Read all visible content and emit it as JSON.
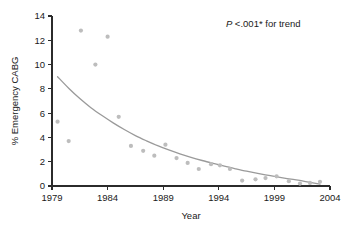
{
  "chart_data": {
    "type": "scatter",
    "title": "",
    "xlabel": "Year",
    "ylabel": "% Emergency CABG",
    "xlim": [
      1979,
      2004
    ],
    "ylim": [
      0,
      14
    ],
    "xticks": [
      1979,
      1984,
      1989,
      1994,
      1999,
      2004
    ],
    "xtick_labels": [
      "1979",
      "1984",
      "1989",
      "1994",
      "1999",
      "2004"
    ],
    "yticks": [
      0,
      2,
      4,
      6,
      8,
      10,
      12,
      14
    ],
    "ytick_labels": [
      "0",
      "2",
      "4",
      "6",
      "8",
      "10",
      "12",
      "14"
    ],
    "grid": false,
    "legend": false,
    "marker_color": "#bdbdbd",
    "curve_color": "#9a9a9a",
    "axis_color": "#2b2b2b",
    "annotations": [
      {
        "name": "p-value-trend",
        "text_italic": "P",
        "text_rest": " <.001* for trend",
        "full_text": "P <.001* for trend",
        "x": 1998.0,
        "y": 13.1
      }
    ],
    "series": [
      {
        "name": "Observed % emergency CABG",
        "type": "scatter",
        "points": [
          {
            "x": 1979.5,
            "y": 5.3
          },
          {
            "x": 1980.5,
            "y": 3.7
          },
          {
            "x": 1981.6,
            "y": 12.8
          },
          {
            "x": 1982.9,
            "y": 10.0
          },
          {
            "x": 1984.0,
            "y": 12.3
          },
          {
            "x": 1985.0,
            "y": 5.7
          },
          {
            "x": 1986.1,
            "y": 3.3
          },
          {
            "x": 1987.2,
            "y": 2.9
          },
          {
            "x": 1988.2,
            "y": 2.5
          },
          {
            "x": 1989.2,
            "y": 3.4
          },
          {
            "x": 1990.2,
            "y": 2.3
          },
          {
            "x": 1991.2,
            "y": 1.9
          },
          {
            "x": 1992.2,
            "y": 1.4
          },
          {
            "x": 1993.3,
            "y": 1.8
          },
          {
            "x": 1994.1,
            "y": 1.7
          },
          {
            "x": 1995.0,
            "y": 1.4
          },
          {
            "x": 1996.1,
            "y": 0.45
          },
          {
            "x": 1997.3,
            "y": 0.55
          },
          {
            "x": 1998.2,
            "y": 0.65
          },
          {
            "x": 1999.2,
            "y": 0.8
          },
          {
            "x": 2000.3,
            "y": 0.4
          },
          {
            "x": 2001.3,
            "y": 0.2
          },
          {
            "x": 2002.2,
            "y": 0.25
          },
          {
            "x": 2003.1,
            "y": 0.35
          }
        ]
      },
      {
        "name": "Fitted exponential trend",
        "type": "line",
        "points": [
          {
            "x": 1979.5,
            "y": 9.0
          },
          {
            "x": 1980.5,
            "y": 8.05
          },
          {
            "x": 1981.5,
            "y": 7.2
          },
          {
            "x": 1982.5,
            "y": 6.45
          },
          {
            "x": 1983.5,
            "y": 5.8
          },
          {
            "x": 1984.5,
            "y": 5.2
          },
          {
            "x": 1985.5,
            "y": 4.65
          },
          {
            "x": 1986.5,
            "y": 4.15
          },
          {
            "x": 1987.5,
            "y": 3.72
          },
          {
            "x": 1988.5,
            "y": 3.32
          },
          {
            "x": 1989.5,
            "y": 2.97
          },
          {
            "x": 1990.5,
            "y": 2.65
          },
          {
            "x": 1991.5,
            "y": 2.36
          },
          {
            "x": 1992.5,
            "y": 2.1
          },
          {
            "x": 1993.5,
            "y": 1.86
          },
          {
            "x": 1994.5,
            "y": 1.63
          },
          {
            "x": 1995.5,
            "y": 1.42
          },
          {
            "x": 1996.5,
            "y": 1.22
          },
          {
            "x": 1997.5,
            "y": 1.04
          },
          {
            "x": 1998.5,
            "y": 0.87
          },
          {
            "x": 1999.5,
            "y": 0.71
          },
          {
            "x": 2000.5,
            "y": 0.56
          },
          {
            "x": 2001.5,
            "y": 0.42
          },
          {
            "x": 2002.2,
            "y": 0.3
          },
          {
            "x": 2003.1,
            "y": 0.15
          }
        ]
      }
    ]
  }
}
